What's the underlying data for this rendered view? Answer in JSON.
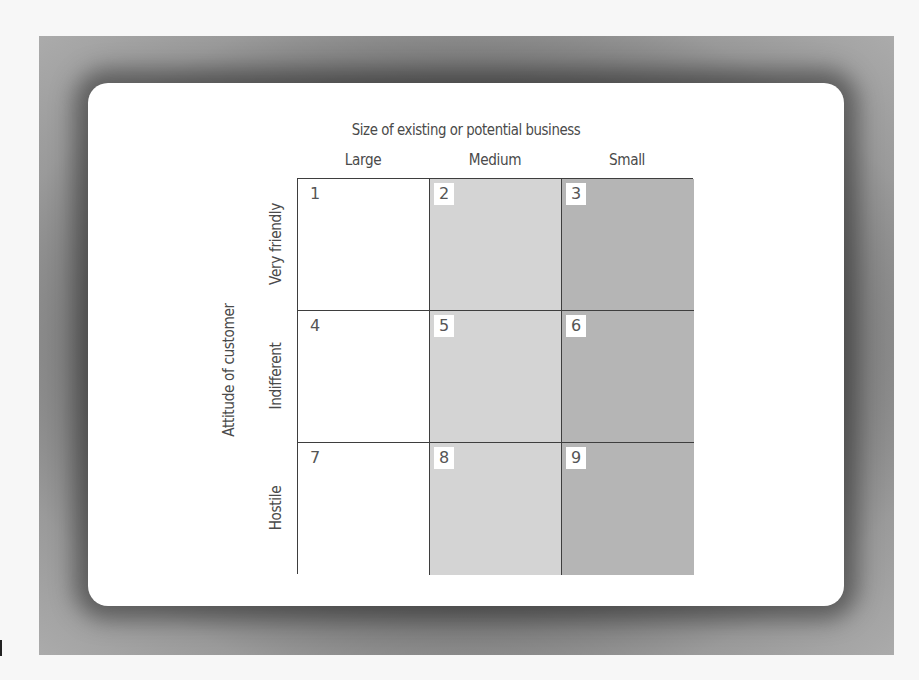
{
  "diagram": {
    "title": "Size of existing or potential business",
    "x_axis": {
      "label": "Size of existing or potential business",
      "columns": [
        "Large",
        "Medium",
        "Small"
      ]
    },
    "y_axis": {
      "label": "Attitude of customer",
      "rows": [
        "Very friendly",
        "Indifferent",
        "Hostile"
      ]
    },
    "cells": [
      {
        "number": "1",
        "row": "Very friendly",
        "column": "Large",
        "shade": "#ffffff"
      },
      {
        "number": "2",
        "row": "Very friendly",
        "column": "Medium",
        "shade": "#d4d4d4"
      },
      {
        "number": "3",
        "row": "Very friendly",
        "column": "Small",
        "shade": "#b5b5b5"
      },
      {
        "number": "4",
        "row": "Indifferent",
        "column": "Large",
        "shade": "#ffffff"
      },
      {
        "number": "5",
        "row": "Indifferent",
        "column": "Medium",
        "shade": "#d4d4d4"
      },
      {
        "number": "6",
        "row": "Indifferent",
        "column": "Small",
        "shade": "#b5b5b5"
      },
      {
        "number": "7",
        "row": "Hostile",
        "column": "Large",
        "shade": "#ffffff"
      },
      {
        "number": "8",
        "row": "Hostile",
        "column": "Medium",
        "shade": "#d4d4d4"
      },
      {
        "number": "9",
        "row": "Hostile",
        "column": "Small",
        "shade": "#b5b5b5"
      }
    ],
    "colors": {
      "column_large": "#ffffff",
      "column_medium": "#d4d4d4",
      "column_small": "#b5b5b5",
      "grid_line": "#3e3e3e",
      "frame": "#a9a9a9",
      "text": "#4a4a4a"
    }
  }
}
